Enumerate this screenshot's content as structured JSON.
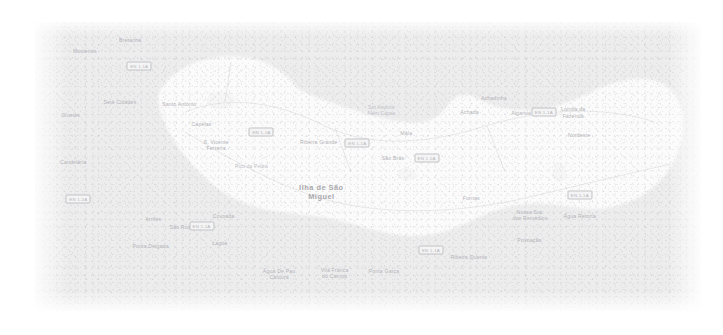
{
  "map": {
    "title": "Ilha de São Miguel",
    "background_color": "#ededee",
    "land_color": "#fafafa",
    "label_color": "#b9b9bc",
    "shield_color": "#f4f4f5",
    "island_label": "Ilha de São\nMiguel",
    "labels": [
      {
        "name": "mosteiros",
        "text": "Mosteiros",
        "x": 15.0,
        "y": 10.7,
        "cls": "town"
      },
      {
        "name": "bretanha",
        "text": "Bretanha",
        "x": 28.6,
        "y": 6.6,
        "cls": "town"
      },
      {
        "name": "sete-cidades",
        "text": "Sete Cidades",
        "x": 25.5,
        "y": 29.8,
        "cls": "town"
      },
      {
        "name": "ginetes",
        "text": "Ginetes",
        "x": 10.7,
        "y": 34.6,
        "cls": "town"
      },
      {
        "name": "candelaria",
        "text": "Candelária",
        "x": 11.5,
        "y": 51.9,
        "cls": "town"
      },
      {
        "name": "santo-antonio",
        "text": "Santo António",
        "x": 43.3,
        "y": 30.4,
        "cls": "town"
      },
      {
        "name": "capelas",
        "text": "Capelas",
        "x": 50.0,
        "y": 38.1,
        "cls": "town"
      },
      {
        "name": "s-vicente-ferreira",
        "text": "S. Vicente\nFerreira",
        "x": 54.4,
        "y": 45.7,
        "cls": "town"
      },
      {
        "name": "pico-da-pedra",
        "text": "Pico da Pedra",
        "x": 65.0,
        "y": 54.0,
        "cls": "minor"
      },
      {
        "name": "ribeira-grande",
        "text": "Ribeira Grande",
        "x": 85.2,
        "y": 44.6,
        "cls": "town"
      },
      {
        "name": "sto-antonio-alem-capas",
        "text": "Sto António\nAlém Capas",
        "x": 104.0,
        "y": 32.9,
        "cls": "minor"
      },
      {
        "name": "maia",
        "text": "Maia",
        "x": 111.5,
        "y": 41.4,
        "cls": "town"
      },
      {
        "name": "sao-bras",
        "text": "São Brás",
        "x": 107.5,
        "y": 50.5,
        "cls": "town"
      },
      {
        "name": "achada",
        "text": "Achada",
        "x": 130.5,
        "y": 33.6,
        "cls": "town"
      },
      {
        "name": "achadinha",
        "text": "Achadinha",
        "x": 137.8,
        "y": 28.4,
        "cls": "town"
      },
      {
        "name": "algarvia",
        "text": "Algarvia",
        "x": 146.0,
        "y": 33.8,
        "cls": "town"
      },
      {
        "name": "lomba-da-fazenda",
        "text": "Lomba da\nFazenda",
        "x": 161.6,
        "y": 33.6,
        "cls": "town"
      },
      {
        "name": "nordeste",
        "text": "Nordeste",
        "x": 163.4,
        "y": 42.1,
        "cls": "town"
      },
      {
        "name": "ilha-de-sao-miguel",
        "text": "Ilha de São\nMiguel",
        "x": 86.0,
        "y": 63.7,
        "cls": "island"
      },
      {
        "name": "furnas",
        "text": "Furnas",
        "x": 131.0,
        "y": 65.3,
        "cls": "town"
      },
      {
        "name": "nossa-sra-dos-remedios",
        "text": "Nossa Sra.\ndos Remédios",
        "x": 148.7,
        "y": 71.6,
        "cls": "town"
      },
      {
        "name": "agua-retorta",
        "text": "Água Retorta",
        "x": 163.6,
        "y": 72.0,
        "cls": "town"
      },
      {
        "name": "povoacao",
        "text": "Povoação",
        "x": 148.5,
        "y": 81.0,
        "cls": "town"
      },
      {
        "name": "ribeira-quente",
        "text": "Ribeira Quente",
        "x": 130.3,
        "y": 87.3,
        "cls": "town"
      },
      {
        "name": "ponta-garca",
        "text": "Ponta Garça",
        "x": 104.8,
        "y": 92.4,
        "cls": "town"
      },
      {
        "name": "vila-franca-do-campo",
        "text": "Vila Franca\ndo Campo",
        "x": 90.0,
        "y": 93.3,
        "cls": "town"
      },
      {
        "name": "agua-de-pau-caloura",
        "text": "Água De Pau\nCaloura",
        "x": 73.3,
        "y": 93.5,
        "cls": "town"
      },
      {
        "name": "lagoa",
        "text": "Lagoa",
        "x": 55.5,
        "y": 82.1,
        "cls": "town"
      },
      {
        "name": "covoada",
        "text": "Covoada",
        "x": 56.6,
        "y": 72.2,
        "cls": "town"
      },
      {
        "name": "sao-roque",
        "text": "São Roque",
        "x": 44.5,
        "y": 76.3,
        "cls": "town"
      },
      {
        "name": "arrifes",
        "text": "Arrifes",
        "x": 35.5,
        "y": 73.3,
        "cls": "town"
      },
      {
        "name": "ponta-delgada",
        "text": "Ponta Delgada",
        "x": 34.7,
        "y": 83.3,
        "cls": "town"
      }
    ],
    "shields": [
      {
        "name": "shield-bretanha",
        "text": "EN 1-1A",
        "x": 31.3,
        "y": 16.5
      },
      {
        "name": "shield-west",
        "text": "EN 1-2A",
        "x": 13.0,
        "y": 65.8
      },
      {
        "name": "shield-capelas",
        "text": "EN 1-1A",
        "x": 68.0,
        "y": 40.8
      },
      {
        "name": "shield-ribeira",
        "text": "EN 1-1A",
        "x": 96.8,
        "y": 44.8
      },
      {
        "name": "shield-saobras",
        "text": "EN 1-1A",
        "x": 117.6,
        "y": 50.4
      },
      {
        "name": "shield-algarvia",
        "text": "EN 1-1A",
        "x": 152.8,
        "y": 33.4
      },
      {
        "name": "shield-agua",
        "text": "EN 1-1A",
        "x": 163.6,
        "y": 64.2
      },
      {
        "name": "shield-povoacao",
        "text": "EN 1-1A",
        "x": 118.9,
        "y": 84.8
      },
      {
        "name": "shield-saoroque",
        "text": "EN 1-1A",
        "x": 50.0,
        "y": 75.8
      }
    ]
  }
}
